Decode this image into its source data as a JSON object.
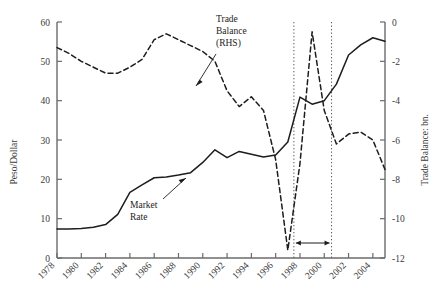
{
  "chart_data": {
    "type": "line",
    "title": "",
    "xlabel": "",
    "ylabel": "Peso/Dollar",
    "y2label": "Trade Balance: bn.",
    "xlim": [
      1978,
      2005
    ],
    "ylim": [
      0,
      60
    ],
    "y2lim": [
      -12,
      0
    ],
    "grid": false,
    "legend": "none",
    "xticks": [
      "1978",
      "1980",
      "1982",
      "1984",
      "1986",
      "1988",
      "1990",
      "1992",
      "1994",
      "1996",
      "1998",
      "2000",
      "2002",
      "2004"
    ],
    "xtick_values": [
      1978,
      1980,
      1982,
      1984,
      1986,
      1988,
      1990,
      1992,
      1994,
      1996,
      1998,
      2000,
      2002,
      2004
    ],
    "yticks": [
      "0",
      "10",
      "20",
      "30",
      "40",
      "50",
      "60"
    ],
    "ytick_values": [
      0,
      10,
      20,
      30,
      40,
      50,
      60
    ],
    "y2ticks": [
      "0",
      "-2",
      "-4",
      "-6",
      "-8",
      "-10",
      "-12"
    ],
    "y2tick_values": [
      0,
      -2,
      -4,
      -6,
      -8,
      -10,
      -12
    ],
    "series": [
      {
        "name": "Market Rate",
        "axis": "left",
        "style": "solid",
        "color": "#1d1d1d",
        "x": [
          1978,
          1979,
          1980,
          1981,
          1982,
          1983,
          1984,
          1985,
          1986,
          1987,
          1988,
          1989,
          1990,
          1991,
          1992,
          1993,
          1994,
          1995,
          1996,
          1997,
          1998,
          1999,
          2000,
          2001,
          2002,
          2003,
          2004,
          2005
        ],
        "values": [
          7.4,
          7.4,
          7.5,
          7.8,
          8.5,
          11.1,
          16.7,
          18.6,
          20.4,
          20.6,
          21.1,
          21.7,
          24.3,
          27.5,
          25.5,
          27.1,
          26.4,
          25.7,
          26.2,
          29.5,
          40.9,
          39.1,
          40.0,
          44.2,
          51.6,
          54.2,
          56.0,
          55.1
        ]
      },
      {
        "name": "Trade Balance (RHS)",
        "axis": "right",
        "style": "dashed",
        "color": "#1d1d1d",
        "x": [
          1978,
          1979,
          1980,
          1981,
          1982,
          1983,
          1984,
          1985,
          1986,
          1987,
          1988,
          1989,
          1990,
          1991,
          1992,
          1993,
          1994,
          1995,
          1996,
          1997,
          1998,
          1999,
          2000,
          2001,
          2002,
          2003,
          2004,
          2005
        ],
        "values": [
          -1.3,
          -1.6,
          -2.0,
          -2.3,
          -2.6,
          -2.6,
          -2.3,
          -1.9,
          -0.9,
          -0.6,
          -0.9,
          -1.2,
          -1.5,
          -2.0,
          -3.5,
          -4.3,
          -3.8,
          -4.5,
          -7.0,
          -11.6,
          -7.2,
          -0.5,
          -4.5,
          -6.2,
          -5.7,
          -5.6,
          -6.0,
          -7.5
        ]
      }
    ],
    "annotations": [
      {
        "name": "trade-balance-label",
        "text_lines": [
          "Trade",
          "Balance",
          "(RHS)"
        ],
        "x": 1991.5,
        "y_axis": "right",
        "target_year": 1990.6
      },
      {
        "name": "market-rate-label",
        "text_lines": [
          "Market",
          "Rate"
        ],
        "x": 1988.5,
        "y_axis": "left",
        "target_year": 1991.2
      }
    ],
    "vertical_markers": {
      "name": "crisis-window",
      "style": "dotted",
      "x_values": [
        1997.5,
        2000.6
      ],
      "span_arrow": true
    }
  }
}
